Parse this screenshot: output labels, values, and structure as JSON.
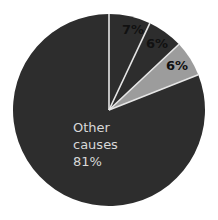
{
  "chart_data": {
    "type": "pie",
    "title": "",
    "start_angle_deg": 0,
    "direction": "clockwise",
    "slices": [
      {
        "label": "",
        "value": 7,
        "display": "7%",
        "color": "#2d2d2d"
      },
      {
        "label": "",
        "value": 6,
        "display": "6%",
        "color": "#2d2d2d"
      },
      {
        "label": "",
        "value": 6,
        "display": "6%",
        "color": "#9c9c9c"
      },
      {
        "label": "Other causes",
        "value": 81,
        "display": "81%",
        "color": "#2d2d2d"
      }
    ],
    "separator_color": "#e6e6e6",
    "legend": "none"
  },
  "labels": {
    "slice1": "7%",
    "slice2": "6%",
    "slice3": "6%",
    "other_line1": "Other",
    "other_line2": "causes",
    "other_line3": "81%"
  }
}
